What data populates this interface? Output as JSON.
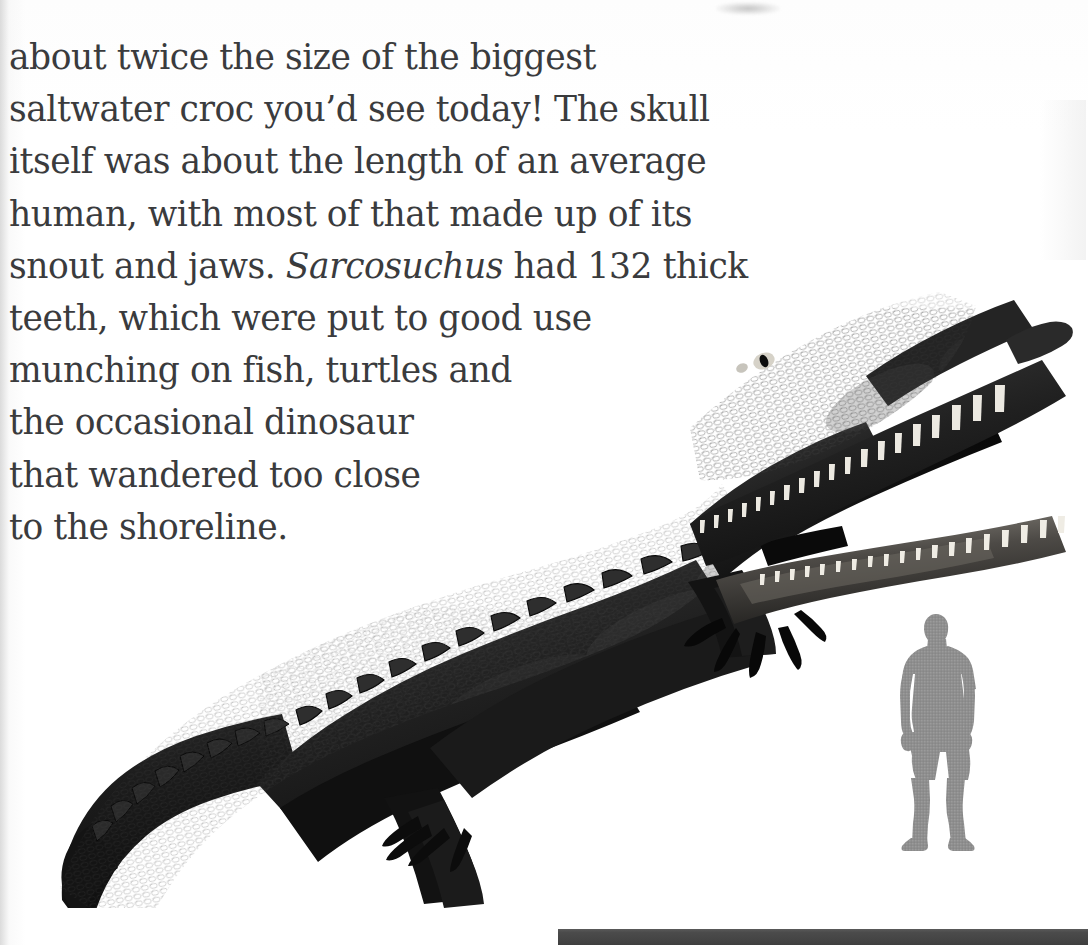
{
  "page": {
    "background_color": "#ffffff",
    "text_color": "#3a3b3d",
    "gutter_shadow_color": "#bebebe"
  },
  "body_text": {
    "full_text": "about twice the size of the biggest saltwater croc you'd see today! The skull itself was about the length of an average human, with most of that made up of its snout and jaws. Sarcosuchus had 132 thick teeth, which were put to good use munching on fish, turtles and the occasional dinosaur that wandered too close to the shoreline.",
    "lines": [
      "about twice the size of the biggest",
      "saltwater croc you’d see today! The skull",
      "itself was about the length of an average",
      "human, with most of that made up of its",
      "snout and jaws. ",
      "teeth, which were put to good use",
      "munching on fish, turtles and",
      "the occasional dinosaur",
      "that wandered too close",
      "to the shoreline."
    ],
    "line5_italic_genus": "Sarcosuchus",
    "line5_after_italic": " had 132 thick",
    "tooth_count": "132"
  },
  "figure": {
    "subject_name": "Sarcosuchus",
    "subject_caption": "crocodile model photograph",
    "scale_figure_name": "human scale silhouette",
    "scale_figure_color": "#919191",
    "croc_color": "#141414",
    "tooth_color": "#e8e6e0",
    "ground_bar_color": "#4a4a4a"
  }
}
